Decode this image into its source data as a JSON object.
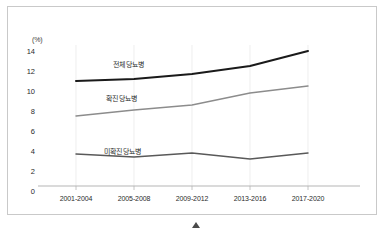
{
  "chart_data": {
    "type": "line",
    "title": "",
    "subtitle": "",
    "xlabel": "",
    "ylabel": "",
    "unit_label": "(%)",
    "categories": [
      "2001-2004",
      "2005-2008",
      "2009-2012",
      "2013-2016",
      "2017-2020"
    ],
    "ylim": [
      0,
      14
    ],
    "ytick_labels": [
      "0",
      "2",
      "4",
      "6",
      "8",
      "10",
      "12",
      "14"
    ],
    "ytick_values": [
      0,
      2,
      4,
      6,
      8,
      10,
      12,
      14
    ],
    "grid": "vertical-only",
    "legend_position": "inline-labels",
    "series": [
      {
        "name": "전체 당뇨병",
        "values": [
          10.5,
          10.7,
          11.2,
          12.0,
          13.5
        ],
        "color": "#1a1a1a",
        "width": 2.0
      },
      {
        "name": "확진 당뇨병",
        "values": [
          7.0,
          7.6,
          8.1,
          9.3,
          10.0
        ],
        "color": "#8c8c8c",
        "width": 1.4
      },
      {
        "name": "미확진 당뇨병",
        "values": [
          3.2,
          2.9,
          3.3,
          2.7,
          3.3
        ],
        "color": "#595959",
        "width": 1.4
      }
    ],
    "annotations": [
      {
        "text": "전체 당뇨병",
        "x": 112,
        "y": 56
      },
      {
        "text": "확진 당뇨병",
        "x": 105,
        "y": 90
      },
      {
        "text": "미확진 당뇨병",
        "x": 103,
        "y": 143
      }
    ],
    "colors": {
      "axis": "#b5b5b5",
      "gridline": "#e2e2e2",
      "frame": "#c9c9c9",
      "text": "#2b2b2b"
    }
  }
}
